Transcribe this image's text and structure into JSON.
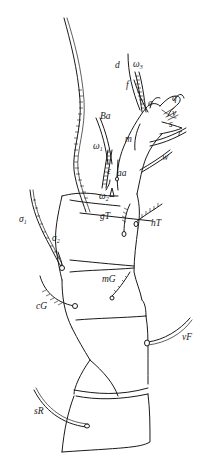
{
  "figure": {
    "background_color": "#ffffff",
    "line_color": "#1a1a1a",
    "labels": {
      "d": "d",
      "omega3": "ω",
      "omega3_sub": "3",
      "f": "f",
      "e": "e",
      "q": "q",
      "v": "v",
      "s": "s",
      "r": "r",
      "w": "w",
      "m": "m",
      "Ba": "Ba",
      "omega1": "ω",
      "omega1_sub": "1",
      "epsilon": "ε",
      "aa": "aa",
      "omega2": "ω",
      "omega2_sub": "2",
      "gT": "gT",
      "hT": "hT",
      "sigma1": "σ",
      "sigma1_sub": "1",
      "sigma2": "σ",
      "sigma2_sub": "2",
      "mG": "mG",
      "cG": "cG",
      "vF": "vF",
      "sR": "sR"
    },
    "segments": [
      "tarsus",
      "tibia",
      "genu",
      "femur",
      "trochanter"
    ]
  }
}
